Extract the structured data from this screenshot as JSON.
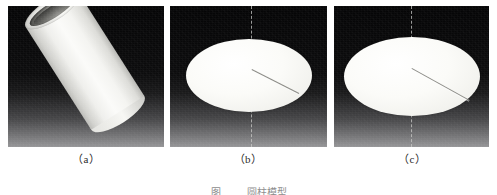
{
  "figure": {
    "panels": [
      {
        "id": "a",
        "label": "（a）",
        "subject": "cylindrical-tube-specimen",
        "background": "#111012"
      },
      {
        "id": "b",
        "label": "（b）",
        "subject": "elliptical-disc-specimen",
        "background": "#111012"
      },
      {
        "id": "c",
        "label": "（c）",
        "subject": "elliptical-disc-specimen",
        "background": "#111012"
      }
    ],
    "caption": {
      "number": "图",
      "text": "圆柱模型"
    },
    "colors": {
      "panel_background": "#111012",
      "specimen_light": "#fbfbf9",
      "specimen_shadow": "#b9b9b5",
      "dashed_axis": "#c8c8c6",
      "radius_line": "#8b8b86",
      "page_background": "#ffffff",
      "label_text": "#2b2b2b"
    }
  }
}
